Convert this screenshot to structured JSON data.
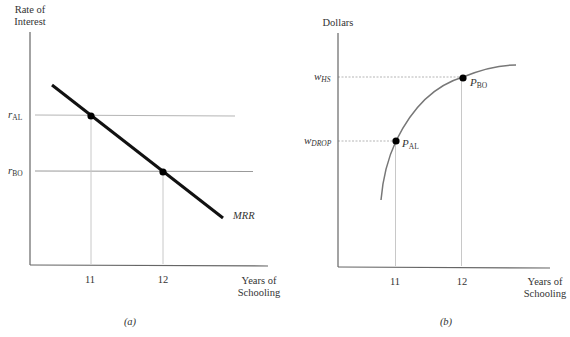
{
  "panel_a": {
    "caption": "(a)",
    "y_axis_label_line1": "Rate of",
    "y_axis_label_line2": "Interest",
    "x_axis_label_line1": "Years of",
    "x_axis_label_line2": "Schooling",
    "x_ticks": [
      "11",
      "12"
    ],
    "rate_al": {
      "main": "r",
      "sub": "AL"
    },
    "rate_bo": {
      "main": "r",
      "sub": "BO"
    },
    "curve_label": "MRR"
  },
  "panel_b": {
    "caption": "(b)",
    "y_axis_label": "Dollars",
    "x_axis_label_line1": "Years of",
    "x_axis_label_line2": "Schooling",
    "x_ticks": [
      "11",
      "12"
    ],
    "wage_hs": {
      "main": "w",
      "sub": "HS"
    },
    "wage_drop": {
      "main": "w",
      "sub": "DROP"
    },
    "point_al": {
      "main": "P",
      "sub": "AL"
    },
    "point_bo": {
      "main": "P",
      "sub": "BO"
    }
  },
  "colors": {
    "axis": "#555555",
    "mrr_line": "#111111",
    "guide": "#b5b5b5",
    "curve": "#777777",
    "point": "#000000"
  }
}
